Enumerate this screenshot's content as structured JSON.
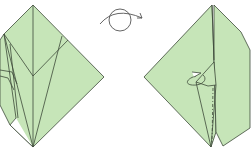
{
  "diagram": {
    "type": "origami-fold-instructions",
    "steps": [
      {
        "id": "before",
        "description": "crane base folded model, front view"
      },
      {
        "id": "symbol",
        "description": "turn model over symbol"
      },
      {
        "id": "after",
        "description": "model turned over with reverse fold arrow"
      }
    ]
  },
  "colors": {
    "paper": "#c6e5b8",
    "line": "#3d4a3a",
    "background": "#ffffff",
    "symbol": "#555555"
  }
}
